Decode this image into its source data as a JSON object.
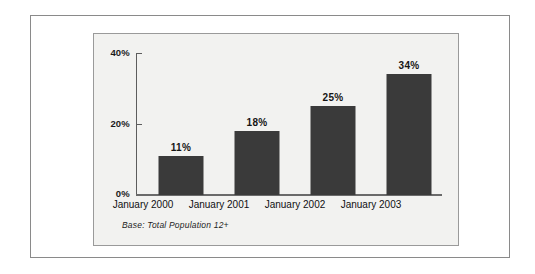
{
  "frame": {
    "outer_border_color": "#8a8a8a",
    "panel_background": "#f2f2f0",
    "panel_border_color": "#9a9a9a"
  },
  "chart_data": {
    "type": "bar",
    "title": "",
    "subtitle": "",
    "xlabel": "",
    "ylabel": "",
    "categories": [
      "January 2000",
      "January 2001",
      "January 2002",
      "January 2003"
    ],
    "values": [
      11,
      18,
      25,
      34
    ],
    "value_labels": [
      "11%",
      "18%",
      "25%",
      "34%"
    ],
    "ylim": [
      0,
      40
    ],
    "yticks": [
      0,
      20,
      40
    ],
    "ytick_labels": [
      "0%",
      "20%",
      "40%"
    ],
    "grid": false,
    "legend": null,
    "bar_color": "#3a3a3a",
    "annotations": [
      "Base: Total Population 12+"
    ],
    "series": [
      {
        "name": "Percent",
        "values": [
          11,
          18,
          25,
          34
        ]
      }
    ]
  },
  "axis": {
    "y_labels": {
      "top": "40%",
      "middle": "20%",
      "bottom": "0%"
    }
  },
  "footnote": {
    "text": "Base: Total Population 12+"
  }
}
